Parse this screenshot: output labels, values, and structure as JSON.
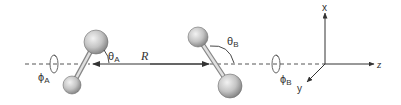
{
  "diagram": {
    "type": "molecular-coordinate-system",
    "labels": {
      "theta_a": "θ",
      "theta_a_sub": "A",
      "theta_b": "θ",
      "theta_b_sub": "B",
      "phi_a": "ϕ",
      "phi_a_sub": "A",
      "phi_b": "ϕ",
      "phi_b_sub": "B",
      "distance": "R",
      "axis_x": "x",
      "axis_y": "y",
      "axis_z": "z"
    },
    "colors": {
      "line": "#333333",
      "dashed": "#555555",
      "sphere_light": "#f0f0f0",
      "sphere_mid": "#bdbdbd",
      "sphere_dark": "#7a7a7a",
      "bond": "#b0b0b0"
    }
  }
}
